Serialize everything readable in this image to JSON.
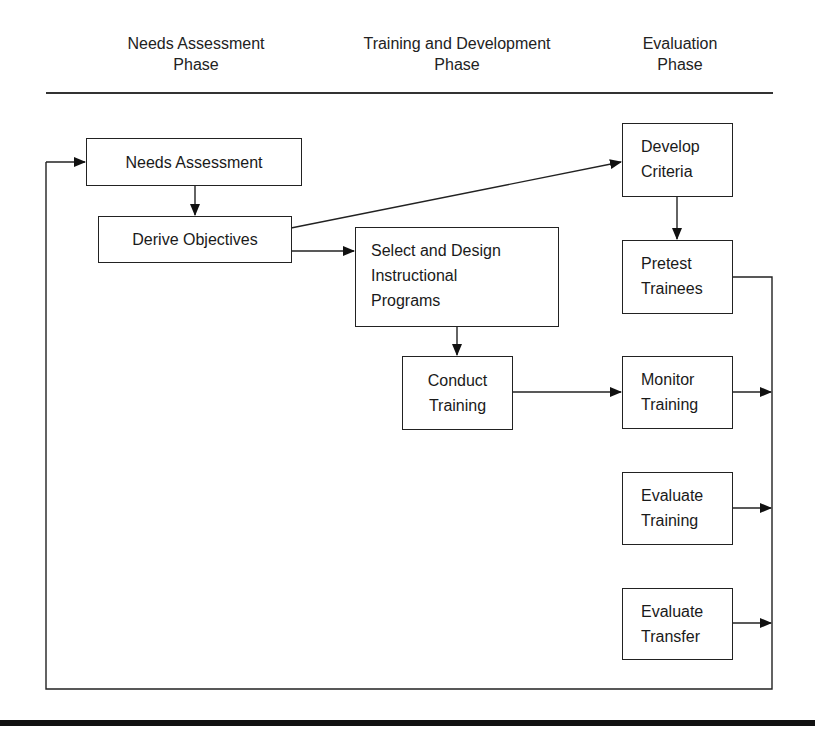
{
  "phases": [
    {
      "line1": "Needs Assessment",
      "line2": "Phase"
    },
    {
      "line1": "Training and Development",
      "line2": "Phase"
    },
    {
      "line1": "Evaluation",
      "line2": "Phase"
    }
  ],
  "nodes": {
    "needs_assessment": {
      "label": "Needs Assessment"
    },
    "derive_objectives": {
      "label": "Derive Objectives"
    },
    "select_design": {
      "line1": "Select and Design",
      "line2": "Instructional",
      "line3": "Programs"
    },
    "conduct_training": {
      "line1": "Conduct",
      "line2": "Training"
    },
    "develop_criteria": {
      "line1": "Develop",
      "line2": "Criteria"
    },
    "pretest_trainees": {
      "line1": "Pretest",
      "line2": "Trainees"
    },
    "monitor_training": {
      "line1": "Monitor",
      "line2": "Training"
    },
    "evaluate_training": {
      "line1": "Evaluate",
      "line2": "Training"
    },
    "evaluate_transfer": {
      "line1": "Evaluate",
      "line2": "Transfer"
    }
  },
  "edges": [
    {
      "from": "Needs Assessment",
      "to": "Derive Objectives"
    },
    {
      "from": "Derive Objectives",
      "to": "Select and Design Instructional Programs"
    },
    {
      "from": "Derive Objectives",
      "to": "Develop Criteria"
    },
    {
      "from": "Select and Design Instructional Programs",
      "to": "Conduct Training"
    },
    {
      "from": "Conduct Training",
      "to": "Monitor Training"
    },
    {
      "from": "Develop Criteria",
      "to": "Pretest Trainees"
    },
    {
      "from": "Pretest Trainees",
      "to": "Feedback loop"
    },
    {
      "from": "Monitor Training",
      "to": "Feedback loop"
    },
    {
      "from": "Evaluate Training",
      "to": "Feedback loop"
    },
    {
      "from": "Evaluate Transfer",
      "to": "Feedback loop"
    },
    {
      "from": "Feedback loop",
      "to": "Needs Assessment"
    }
  ],
  "colors": {
    "line": "#222222",
    "background": "#ffffff"
  }
}
